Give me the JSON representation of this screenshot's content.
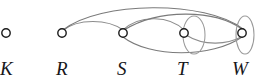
{
  "figure": {
    "kind": "undirected-multigraph-diagram",
    "background": "#ffffff",
    "width": 260,
    "height": 82,
    "edge_color": "#8d8d8d",
    "vertex_stroke": "#1a1a1a",
    "vertex_fill": "#ffffff",
    "label_color": "#16161a"
  },
  "nodes": [
    {
      "id": "K",
      "label": "K",
      "cx": 6,
      "cy": 33,
      "r": 4.2,
      "label_x": 0,
      "label_y": 59
    },
    {
      "id": "R",
      "label": "R",
      "cx": 62,
      "cy": 33,
      "r": 4.2,
      "label_x": 56,
      "label_y": 59
    },
    {
      "id": "S",
      "label": "S",
      "cx": 123,
      "cy": 33,
      "r": 4.2,
      "label_x": 117,
      "label_y": 59
    },
    {
      "id": "T",
      "label": "T",
      "cx": 184,
      "cy": 33,
      "r": 4.2,
      "label_x": 177,
      "label_y": 59
    },
    {
      "id": "W",
      "label": "W",
      "cx": 242,
      "cy": 33,
      "r": 4.2,
      "label_x": 232,
      "label_y": 59
    }
  ],
  "edges": [
    {
      "id": "e-r-s-upper",
      "from": "R",
      "to": "S",
      "style": "arc-above",
      "path": "M 62 31 C 78 18, 108 19, 123 30"
    },
    {
      "id": "e-r-w-top",
      "from": "R",
      "to": "W",
      "style": "arc-above-tall",
      "path": "M 63 30 C 100 1, 205 0, 243 29"
    },
    {
      "id": "e-s-t-upper",
      "from": "S",
      "to": "T",
      "style": "arc-above",
      "path": "M 123 30 C 140 14, 170 16, 184 30"
    },
    {
      "id": "e-s-w-upper",
      "from": "S",
      "to": "W",
      "style": "arc-above",
      "path": "M 124 30 C 160 8, 215 10, 242 29"
    },
    {
      "id": "e-s-w-lower",
      "from": "S",
      "to": "W",
      "style": "arc-below",
      "path": "M 123 37 C 150 58, 212 58, 242 37"
    },
    {
      "id": "e-t-w-lower",
      "from": "T",
      "to": "W",
      "style": "arc-below-short",
      "path": "M 186 35 C 205 47, 228 44, 241 37"
    },
    {
      "id": "e-t-loop",
      "from": "T",
      "to": "T",
      "style": "self-loop-ellipse",
      "cx": 194,
      "cy": 35,
      "rx": 11,
      "ry": 19
    },
    {
      "id": "e-w-loop",
      "from": "W",
      "to": "W",
      "style": "self-loop-ellipse",
      "cx": 245,
      "cy": 35,
      "rx": 9,
      "ry": 19
    }
  ]
}
